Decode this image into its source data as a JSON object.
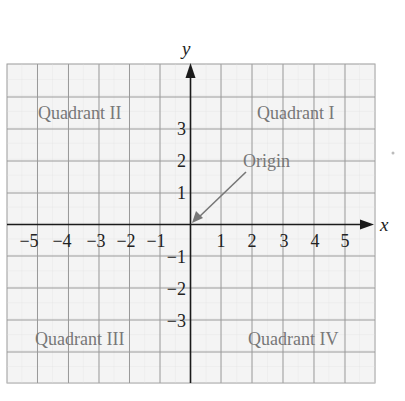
{
  "diagram": {
    "axes": {
      "x_label": "x",
      "y_label": "y",
      "x_ticks": [
        "−5",
        "−4",
        "−3",
        "−2",
        "−1",
        "1",
        "2",
        "3",
        "4",
        "5"
      ],
      "y_ticks": [
        "3",
        "2",
        "1",
        "−1",
        "−2",
        "−3"
      ]
    },
    "quadrants": {
      "q1": "Quadrant I",
      "q2": "Quadrant II",
      "q3": "Quadrant III",
      "q4": "Quadrant IV"
    },
    "origin_label": "Origin",
    "colors": {
      "grid_fill": "#f3f3f3",
      "grid_line": "#9a9a9a",
      "minor_line": "#d6d6d6",
      "axis": "#1a1a1a",
      "quadrant_text": "#777777",
      "tick_text": "#222222",
      "pointer": "#777777"
    }
  }
}
